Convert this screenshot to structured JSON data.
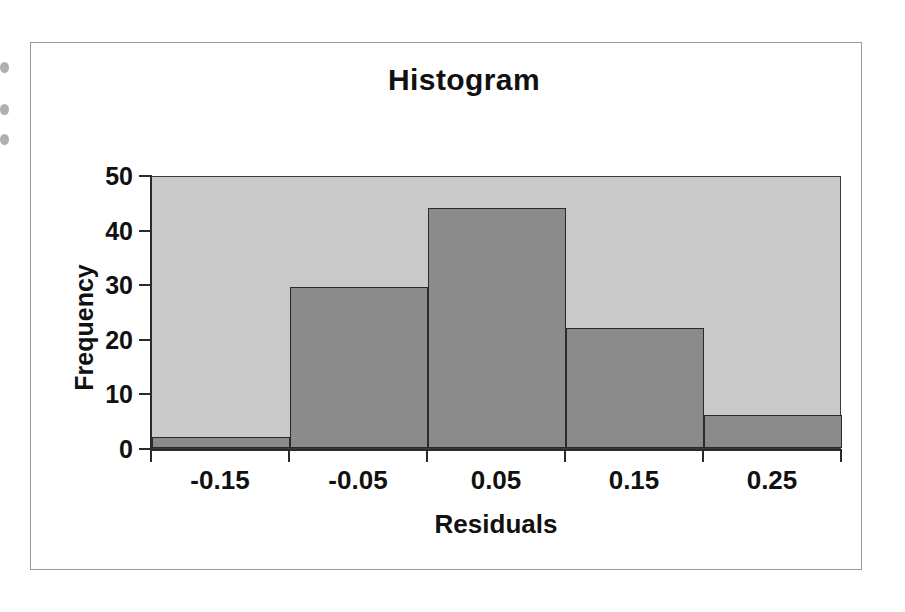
{
  "chart_data": {
    "type": "bar",
    "title": "Histogram",
    "xlabel": "Residuals",
    "ylabel": "Frequency",
    "categories": [
      "-0.15",
      "-0.05",
      "0.05",
      "0.15",
      "0.25"
    ],
    "values": [
      2,
      29.5,
      44,
      22,
      6
    ],
    "ylim": [
      0,
      50
    ],
    "yticks": [
      0,
      10,
      20,
      30,
      40,
      50
    ],
    "ytick_labels": [
      "0",
      "10",
      "20",
      "30",
      "40",
      "50"
    ],
    "grid": false,
    "legend": "none",
    "bar_gap": 0,
    "colors": {
      "plot_background": "#c9c9c9",
      "bar_fill": "#8b8b8b",
      "bar_outline": "#2b2b2b",
      "axis": "#2b2b2b",
      "text": "#111111",
      "figure_background": "#ffffff",
      "figure_border": "#9a9a9a"
    }
  }
}
